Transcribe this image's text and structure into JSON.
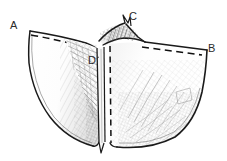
{
  "figure": {
    "kind": "ink-line-drawing",
    "background_color": "#ffffff",
    "ink_color": "#1a1a1a",
    "shading_color": "#6b6b6b",
    "label_color": "#2b2b2b",
    "width": 227,
    "height": 161,
    "labels": [
      {
        "id": "a",
        "text": "A",
        "x": 10,
        "y": 20
      },
      {
        "id": "c",
        "text": "C",
        "x": 129,
        "y": 11
      },
      {
        "id": "b",
        "text": "B",
        "x": 208,
        "y": 43
      },
      {
        "id": "d",
        "text": "D",
        "x": 88,
        "y": 55
      }
    ],
    "annotations": {
      "dashed_top_left_edge": "A to centre ridge",
      "dashed_top_right_edge": "centre ridge to B",
      "dashed_centre_line": "vertical line from D downward"
    }
  }
}
